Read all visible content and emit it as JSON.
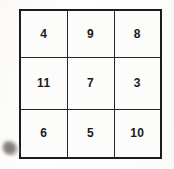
{
  "image": {
    "title": "3x3 number grid",
    "background_color": "#fdfdfc",
    "ink_color": "#1a1a1a",
    "border_color": "#1c1c1c"
  },
  "grid": {
    "rows": 3,
    "columns": 3,
    "cells": [
      [
        "4",
        "9",
        "8"
      ],
      [
        "11",
        "7",
        "3"
      ],
      [
        "6",
        "5",
        "10"
      ]
    ]
  },
  "artifacts": {
    "smudge": {
      "name": "gray-smudge",
      "color": "#8f8c8a",
      "position": "bottom-left"
    }
  }
}
